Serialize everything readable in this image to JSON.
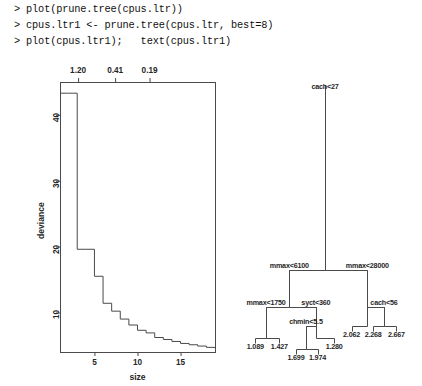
{
  "console": {
    "lines": [
      "> plot(prune.tree(cpus.ltr))",
      "> cpus.ltr1 <- prune.tree(cpus.ltr, best=8)",
      "> plot(cpus.ltr1);   text(cpus.ltr1)"
    ]
  },
  "chart_data": [
    {
      "type": "line",
      "title": "",
      "subtitle": "",
      "xlabel": "size",
      "ylabel": "deviance",
      "xlim": [
        1,
        19
      ],
      "ylim": [
        4,
        45
      ],
      "grid": false,
      "legend": null,
      "step": "hv",
      "top_axis": {
        "label": "cost-complexity parameter",
        "tick_values": [
          "1.20",
          "0.41",
          "0.19"
        ],
        "tick_positions": [
          3.1,
          7.4,
          11.4
        ]
      },
      "x_ticks": [
        5,
        10,
        15
      ],
      "y_ticks": [
        10,
        20,
        30,
        40
      ],
      "x": [
        1,
        2,
        3,
        4,
        5,
        6,
        7,
        8,
        9,
        10,
        11,
        12,
        13,
        14,
        15,
        16,
        17,
        18,
        19
      ],
      "y": [
        43.3,
        43.3,
        19.6,
        19.6,
        15.5,
        11.4,
        10.2,
        9.0,
        8.1,
        7.3,
        6.9,
        6.2,
        5.9,
        5.6,
        5.3,
        5.1,
        4.9,
        4.7,
        4.6
      ],
      "values": [
        43.3,
        43.3,
        19.6,
        19.6,
        15.5,
        11.4,
        10.2,
        9.0,
        8.1,
        7.3,
        6.9,
        6.2,
        5.9,
        5.6,
        5.3,
        5.1,
        4.9,
        4.7,
        4.6
      ]
    },
    {
      "type": "tree",
      "title": "",
      "xlabel": "",
      "ylabel": "",
      "grid": false,
      "nodes": [
        {
          "id": "n1",
          "label": "cach<27",
          "kind": "split",
          "x": 50.0,
          "y": 4.0,
          "depth": 0
        },
        {
          "id": "n2",
          "label": "mmax<6100",
          "kind": "split",
          "x": 28.5,
          "y": 70.5,
          "depth": 1
        },
        {
          "id": "n3",
          "label": "mmax<28000",
          "kind": "split",
          "x": 75.5,
          "y": 70.5,
          "depth": 1
        },
        {
          "id": "n4",
          "label": "mmax<1750",
          "kind": "split",
          "x": 14.5,
          "y": 84.0,
          "depth": 2
        },
        {
          "id": "n5",
          "label": "syct<360",
          "kind": "split",
          "x": 44.5,
          "y": 84.0,
          "depth": 2
        },
        {
          "id": "n6",
          "label": "2.062",
          "kind": "leaf",
          "x": 66.0,
          "y": 91.0,
          "depth": 2
        },
        {
          "id": "n7",
          "label": "cach<56",
          "kind": "split",
          "x": 85.5,
          "y": 84.0,
          "depth": 2
        },
        {
          "id": "n8",
          "label": "1.089",
          "kind": "leaf",
          "x": 8.0,
          "y": 95.5,
          "depth": 3
        },
        {
          "id": "n9",
          "label": "1.427",
          "kind": "leaf",
          "x": 22.5,
          "y": 95.5,
          "depth": 3
        },
        {
          "id": "n10",
          "label": "chmin<5.5",
          "kind": "split",
          "x": 38.5,
          "y": 91.0,
          "depth": 3
        },
        {
          "id": "n11",
          "label": "1.280",
          "kind": "leaf",
          "x": 55.5,
          "y": 95.5,
          "depth": 3
        },
        {
          "id": "n12",
          "label": "2.268",
          "kind": "leaf",
          "x": 79.0,
          "y": 91.0,
          "depth": 3
        },
        {
          "id": "n13",
          "label": "2.667",
          "kind": "leaf",
          "x": 93.0,
          "y": 91.0,
          "depth": 3
        },
        {
          "id": "n14",
          "label": "1.699",
          "kind": "leaf",
          "x": 32.5,
          "y": 99.5,
          "depth": 4
        },
        {
          "id": "n15",
          "label": "1.974",
          "kind": "leaf",
          "x": 45.5,
          "y": 99.5,
          "depth": 4
        }
      ],
      "edges": [
        [
          "n1",
          "n2"
        ],
        [
          "n1",
          "n3"
        ],
        [
          "n2",
          "n4"
        ],
        [
          "n2",
          "n5"
        ],
        [
          "n3",
          "n6"
        ],
        [
          "n3",
          "n7"
        ],
        [
          "n4",
          "n8"
        ],
        [
          "n4",
          "n9"
        ],
        [
          "n5",
          "n10"
        ],
        [
          "n5",
          "n11"
        ],
        [
          "n7",
          "n12"
        ],
        [
          "n7",
          "n13"
        ],
        [
          "n10",
          "n14"
        ],
        [
          "n10",
          "n15"
        ]
      ],
      "split_labels": [
        "cach<27",
        "mmax<6100",
        "mmax<28000",
        "mmax<1750",
        "syct<360",
        "cach<56",
        "chmin<5.5"
      ],
      "leaf_values": [
        "1.089",
        "1.427",
        "1.699",
        "1.974",
        "1.280",
        "2.062",
        "2.268",
        "2.667"
      ]
    }
  ],
  "colors": {
    "line": "#4a4a4a",
    "text": "#262626",
    "background": "#ffffff"
  }
}
